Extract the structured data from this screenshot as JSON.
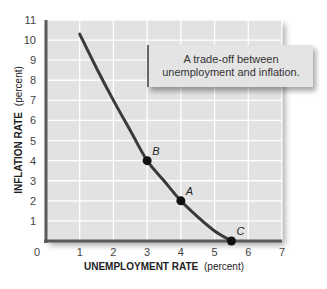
{
  "chart_data": {
    "type": "line",
    "title": "",
    "xlabel": "UNEMPLOYMENT RATE (percent)",
    "ylabel": "INFLATION RATE (percent)",
    "xlabel_bold": "UNEMPLOYMENT RATE",
    "xlabel_unit": "(percent)",
    "ylabel_bold": "INFLATION RATE",
    "ylabel_unit": "(percent)",
    "xlim": [
      0,
      7
    ],
    "ylim": [
      0,
      11
    ],
    "x_ticks": [
      "0",
      "1",
      "2",
      "3",
      "4",
      "5",
      "6",
      "7"
    ],
    "y_ticks": [
      "1",
      "2",
      "3",
      "4",
      "5",
      "6",
      "7",
      "8",
      "9",
      "10",
      "11"
    ],
    "grid": true,
    "series": [
      {
        "name": "Phillips curve",
        "x": [
          1.0,
          1.5,
          2.0,
          2.5,
          3.0,
          3.5,
          4.0,
          4.5,
          5.0,
          5.5
        ],
        "y": [
          10.3,
          8.6,
          7.0,
          5.5,
          4.0,
          3.0,
          2.0,
          1.2,
          0.5,
          0.0
        ]
      }
    ],
    "points": [
      {
        "label": "B",
        "x": 3,
        "y": 4
      },
      {
        "label": "A",
        "x": 4,
        "y": 2
      },
      {
        "label": "C",
        "x": 5.5,
        "y": 0
      }
    ],
    "annotations": [
      "A trade-off between unemployment and inflation."
    ]
  },
  "note": {
    "line1": "A trade-off between",
    "line2": "unemployment and inflation."
  },
  "colors": {
    "plot_bg": "#e2e2e2",
    "grid": "#ffffff",
    "axis": "#555555",
    "curve": "#3a3a3a",
    "point": "#111111"
  }
}
